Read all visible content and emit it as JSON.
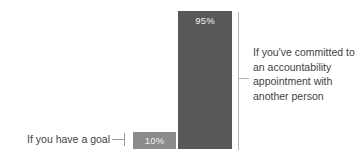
{
  "chart_data": {
    "type": "bar",
    "title": "",
    "subtitle": "",
    "xlabel": "",
    "ylabel": "",
    "ylim": [
      0,
      100
    ],
    "grid": false,
    "legend": "none",
    "orientation": "vertical",
    "categories": [
      "If you have a goal",
      "If you've committed to an accountability appointment with another person"
    ],
    "values": [
      10,
      95
    ],
    "value_labels": [
      "10%",
      "95%"
    ],
    "series": [
      {
        "name": "Probability of completing a goal",
        "values": [
          10,
          95
        ]
      }
    ],
    "colors": {
      "bar_goal": "#8b8b8b",
      "bar_accountability": "#585858",
      "value_label": "#f2f2f2",
      "category_label": "#3f3f3f",
      "leader_line": "#9a9a9a",
      "bracket_line": "#b4b4b4",
      "background": "#ffffff"
    }
  },
  "bars": {
    "goal": {
      "value_label": "10%",
      "category_label": "If you have a goal"
    },
    "accountability": {
      "value_label": "95%",
      "category_label": "If you've committed to an accountability appointment with another person"
    }
  }
}
